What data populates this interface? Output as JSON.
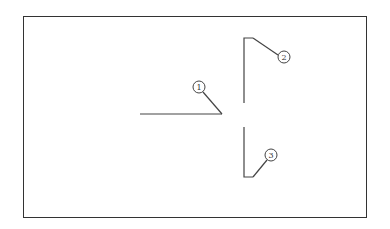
{
  "diagram": {
    "callouts": [
      {
        "id": "1",
        "label": "1"
      },
      {
        "id": "2",
        "label": "2"
      },
      {
        "id": "3",
        "label": "3"
      }
    ],
    "colors": {
      "line": "#444444",
      "frame": "#333333",
      "background": "#ffffff"
    }
  }
}
